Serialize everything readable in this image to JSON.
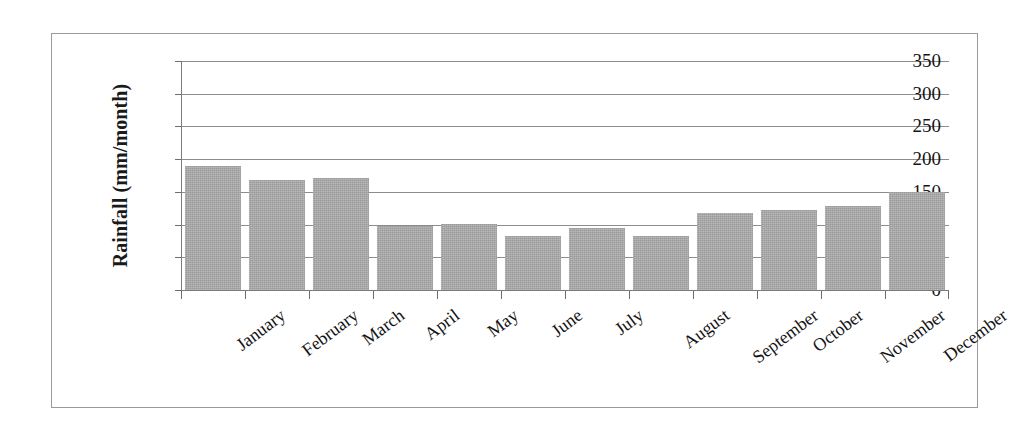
{
  "chart_data": {
    "type": "bar",
    "title": "",
    "xlabel": "",
    "ylabel": "Rainfall (mm/month)",
    "categories": [
      "January",
      "February",
      "March",
      "April",
      "May",
      "June",
      "July",
      "August",
      "September",
      "October",
      "November",
      "December"
    ],
    "values": [
      190,
      168,
      171,
      98,
      101,
      82,
      95,
      82,
      118,
      122,
      128,
      150
    ],
    "ylim": [
      0,
      350
    ],
    "yticks": [
      0,
      50,
      100,
      150,
      200,
      250,
      300,
      350
    ],
    "ytick_labels": [
      "0",
      "50",
      "100",
      "150",
      "200",
      "250",
      "300",
      "350"
    ],
    "grid": true,
    "legend": "none",
    "bar_color": "#a9a9a9",
    "gridline_color": "#8c8c8c",
    "axis_color": "#7a7a7a",
    "frame_color": "#9a9a9a",
    "background_color": "#ffffff",
    "text_color": "#141414"
  }
}
